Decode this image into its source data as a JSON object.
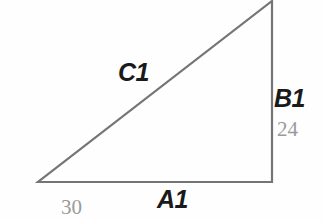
{
  "figure": {
    "type": "right-triangle-diagram",
    "background_color": "#fefefe",
    "stroke_color": "#757575",
    "label_color": "#1a1a1a",
    "value_color": "#9a9a9a",
    "stroke_width": 2.2
  },
  "geometry": {
    "vertices": {
      "bottom_left": {
        "x": 38,
        "y": 182
      },
      "bottom_right": {
        "x": 272,
        "y": 182
      },
      "top_right": {
        "x": 272,
        "y": 1
      }
    },
    "right_angle_at": "bottom_right"
  },
  "sides": [
    {
      "id": "hypotenuse",
      "label": "C1",
      "value": "",
      "position": "upper-left-of-diagonal"
    },
    {
      "id": "vertical-leg",
      "label": "B1",
      "value": "24",
      "position": "right-of-vertical"
    },
    {
      "id": "horizontal-leg",
      "label": "A1",
      "value": "30",
      "position": "below-base"
    }
  ],
  "chart_data": {
    "type": "diagram",
    "title": "",
    "shape": "right triangle",
    "labels": [
      "C1",
      "B1",
      "A1"
    ],
    "values": [
      null,
      24,
      30
    ],
    "annotations": [
      "C1",
      "B1",
      "24",
      "A1",
      "30"
    ]
  }
}
